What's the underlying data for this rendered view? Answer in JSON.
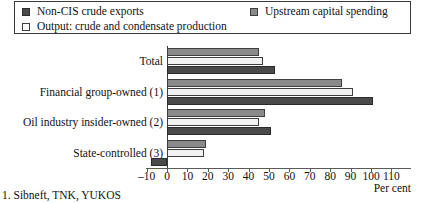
{
  "chart_data": {
    "type": "bar",
    "orientation": "horizontal",
    "title": "",
    "xlabel": "Per cent",
    "ylabel": "",
    "xlim": [
      -10,
      110
    ],
    "xticks": [
      -10,
      0,
      10,
      20,
      30,
      40,
      50,
      60,
      70,
      80,
      90,
      100,
      110
    ],
    "xtick_labels": [
      "–10",
      "0",
      "10",
      "20",
      "30",
      "40",
      "50",
      "60",
      "70",
      "80",
      "90",
      "100",
      "110"
    ],
    "grid": false,
    "legend_position": "top",
    "categories": [
      "Total",
      "Financial group-owned (1)",
      "Oil industry insider-owned (2)",
      "State-controlled (3)"
    ],
    "series": [
      {
        "name": "Upstream capital spending",
        "color": "#8a8a8a",
        "values": [
          45,
          86,
          48,
          19
        ]
      },
      {
        "name": "Output: crude and condensate production",
        "color": "#f2f2f2",
        "values": [
          47,
          91,
          45,
          18
        ]
      },
      {
        "name": "Non-CIS crude exports",
        "color": "#4a4a4a",
        "values": [
          53,
          101,
          51,
          -8
        ]
      }
    ],
    "annotations": [
      "1. Sibneft, TNK, YUKOS"
    ]
  },
  "legend": {
    "items": [
      {
        "label": "Non-CIS crude exports",
        "swatch": "dark-square-icon"
      },
      {
        "label": "Upstream capital spending",
        "swatch": "mid-square-icon"
      },
      {
        "label": "Output: crude and condensate production",
        "swatch": "light-square-icon"
      }
    ]
  },
  "footnote": {
    "text": "1. Sibneft, TNK, YUKOS"
  },
  "axis": {
    "title": "Per cent"
  }
}
